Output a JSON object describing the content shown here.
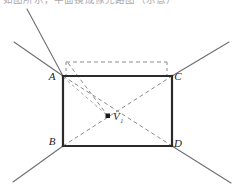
{
  "figure": {
    "caption_clipped": "如图所示，平面镜成像光路图（示意）",
    "background_color": "#ffffff",
    "ink_color": "#2b2b2b",
    "dash_color": "#8a8a90",
    "ray_color": "#6e6e76",
    "labels": {
      "a": "A",
      "b": "B",
      "c": "C",
      "d": "D",
      "v": "V",
      "v_subscript": "1"
    },
    "points": {
      "a": {
        "x": 63,
        "y": 76
      },
      "b": {
        "x": 63,
        "y": 146
      },
      "c": {
        "x": 172,
        "y": 76
      },
      "d": {
        "x": 172,
        "y": 146
      },
      "v": {
        "x": 108,
        "y": 116
      },
      "dashed_top_left": {
        "x": 66,
        "y": 62
      },
      "dashed_top_right": {
        "x": 167,
        "y": 62
      }
    },
    "label_positions": {
      "a": {
        "x": 52,
        "y": 80
      },
      "b": {
        "x": 52,
        "y": 145
      },
      "c": {
        "x": 176,
        "y": 80
      },
      "d": {
        "x": 176,
        "y": 146
      },
      "v": {
        "x": 114,
        "y": 120
      },
      "v_sub": {
        "x": 121,
        "y": 123
      }
    },
    "rays": [
      {
        "name": "ray-a-upper-left",
        "x1": 63,
        "y1": 76,
        "x2": 14,
        "y2": 42
      },
      {
        "name": "ray-a-upper-right",
        "x1": 63,
        "y1": 76,
        "x2": 27,
        "y2": 9
      },
      {
        "name": "ray-c-upper-right",
        "x1": 172,
        "y1": 76,
        "x2": 229,
        "y2": 42
      },
      {
        "name": "ray-b-lower-left",
        "x1": 63,
        "y1": 146,
        "x2": 13,
        "y2": 182
      },
      {
        "name": "ray-d-lower-right",
        "x1": 172,
        "y1": 146,
        "x2": 231,
        "y2": 183
      }
    ],
    "solid_edges": [
      {
        "name": "edge-ac-top",
        "x1": 63,
        "y1": 76,
        "x2": 172,
        "y2": 76
      },
      {
        "name": "edge-bd-bottom",
        "x1": 63,
        "y1": 146,
        "x2": 172,
        "y2": 146
      },
      {
        "name": "edge-ab-left",
        "x1": 63,
        "y1": 76,
        "x2": 63,
        "y2": 146
      },
      {
        "name": "edge-cd-right",
        "x1": 172,
        "y1": 76,
        "x2": 172,
        "y2": 146
      }
    ],
    "dashed_segments": [
      {
        "name": "dashed-rect-top",
        "x1": 66,
        "y1": 62,
        "x2": 167,
        "y2": 62
      },
      {
        "name": "dashed-rect-left",
        "x1": 66,
        "y1": 62,
        "x2": 66,
        "y2": 76
      },
      {
        "name": "dashed-rect-right",
        "x1": 167,
        "y1": 62,
        "x2": 167,
        "y2": 76
      },
      {
        "name": "diagonal-a-d",
        "x1": 63,
        "y1": 76,
        "x2": 172,
        "y2": 146
      },
      {
        "name": "diagonal-b-c",
        "x1": 63,
        "y1": 146,
        "x2": 172,
        "y2": 76
      },
      {
        "name": "dashed-corner-to-v",
        "x1": 68,
        "y1": 63,
        "x2": 108,
        "y2": 116
      },
      {
        "name": "dashed-a-to-v",
        "x1": 63,
        "y1": 77,
        "x2": 108,
        "y2": 116
      }
    ],
    "corner_dots": [
      {
        "name": "dot-a",
        "x": 63,
        "y": 76
      },
      {
        "name": "dot-b",
        "x": 63,
        "y": 146
      },
      {
        "name": "dot-c",
        "x": 172,
        "y": 76
      },
      {
        "name": "dot-d",
        "x": 172,
        "y": 146
      },
      {
        "name": "dot-v",
        "x": 108,
        "y": 116
      }
    ]
  }
}
